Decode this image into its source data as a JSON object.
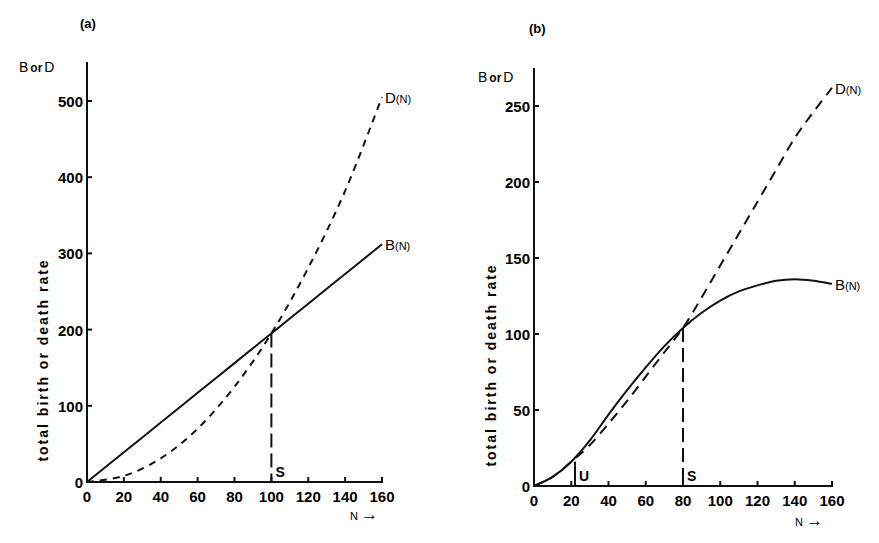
{
  "chart_data": [
    {
      "type": "line",
      "panel": "(a)",
      "corner_label": {
        "b": "B",
        "or": "or",
        "d": "D"
      },
      "ylabel": "total birth or death rate",
      "xlabel": "N",
      "xlabel_arrow": "→",
      "xlim": [
        0,
        160
      ],
      "ylim": [
        0,
        550
      ],
      "x_ticks": [
        0,
        20,
        40,
        60,
        80,
        100,
        120,
        140,
        160
      ],
      "y_ticks": [
        0,
        100,
        200,
        300,
        400,
        500
      ],
      "grid": false,
      "series": [
        {
          "name": "B(N)",
          "label_main": "B",
          "label_sub": "(N)",
          "style": "solid",
          "x": [
            0,
            20,
            40,
            60,
            80,
            100,
            120,
            140,
            160
          ],
          "values": [
            0,
            39,
            78,
            117,
            156,
            195,
            234,
            273,
            312
          ]
        },
        {
          "name": "D(N)",
          "label_main": "D",
          "label_sub": "(N)",
          "style": "dashed",
          "x": [
            0,
            20,
            40,
            60,
            80,
            100,
            120,
            140,
            160
          ],
          "values": [
            0,
            8,
            31,
            70,
            125,
            195,
            281,
            382,
            505
          ]
        }
      ],
      "annotations": [
        {
          "label": "S",
          "x": 100,
          "y": 195,
          "type": "vertical-dashed-drop"
        }
      ]
    },
    {
      "type": "line",
      "panel": "(b)",
      "corner_label": {
        "b": "B",
        "or": "or",
        "d": "D"
      },
      "ylabel": "total birth or death rate",
      "xlabel": "N",
      "xlabel_arrow": "→",
      "xlim": [
        0,
        160
      ],
      "ylim": [
        0,
        275
      ],
      "x_ticks": [
        0,
        20,
        40,
        60,
        80,
        100,
        120,
        140,
        160
      ],
      "y_ticks": [
        0,
        50,
        100,
        150,
        200,
        250
      ],
      "grid": false,
      "series": [
        {
          "name": "B(N)",
          "label_main": "B",
          "label_sub": "(N)",
          "style": "solid",
          "x": [
            0,
            10,
            20,
            30,
            40,
            50,
            60,
            70,
            80,
            90,
            100,
            110,
            120,
            130,
            140,
            150,
            160
          ],
          "values": [
            0,
            6,
            16,
            30,
            47,
            63,
            78,
            92,
            104,
            114,
            122,
            128,
            132,
            135,
            136,
            135,
            133
          ]
        },
        {
          "name": "D(N)",
          "label_main": "D",
          "label_sub": "(N)",
          "style": "dashed",
          "x": [
            0,
            10,
            20,
            30,
            40,
            50,
            60,
            70,
            80,
            90,
            100,
            110,
            120,
            130,
            140,
            150,
            160
          ],
          "values": [
            0,
            6,
            16,
            27,
            41,
            56,
            72,
            88,
            104,
            124,
            145,
            166,
            187,
            208,
            229,
            246,
            262
          ]
        }
      ],
      "annotations": [
        {
          "label": "U",
          "x": 22,
          "y": 16,
          "type": "vertical-solid-drop"
        },
        {
          "label": "S",
          "x": 80,
          "y": 104,
          "type": "vertical-dashed-drop"
        }
      ]
    }
  ]
}
